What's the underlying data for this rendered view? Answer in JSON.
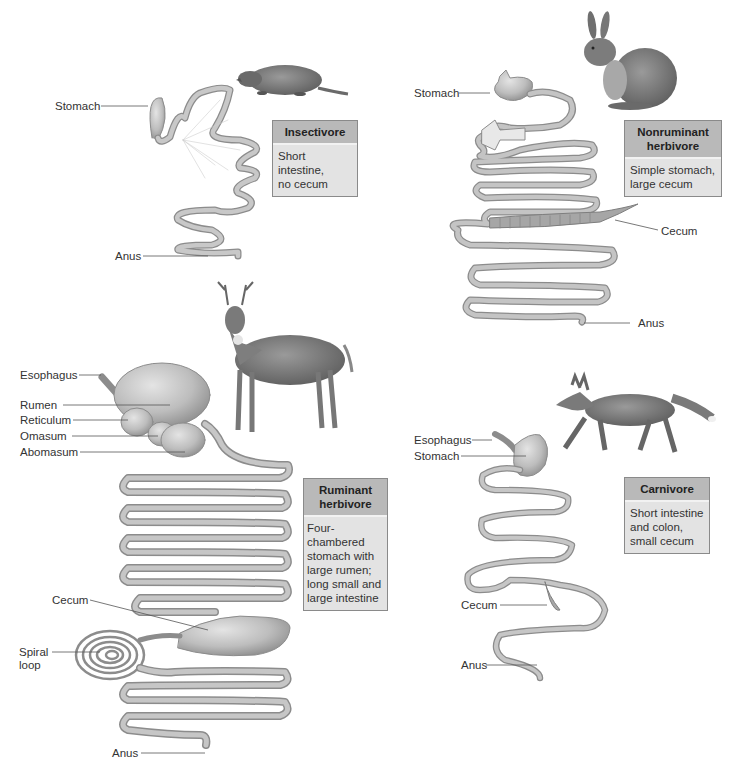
{
  "figure": {
    "colors": {
      "gut_fill": "#bdbdbd",
      "gut_stroke": "#8c8c8c",
      "gut_highlight": "#e6e6e6",
      "label_box_header": "#b9b9b9",
      "label_box_body": "#e3e3e3",
      "leader_line": "#555555"
    },
    "panels": [
      {
        "id": "insectivore",
        "animal": "shrew",
        "title": "Insectivore",
        "description": "Short intestine, no cecum",
        "labels": [
          "Stomach",
          "Anus"
        ]
      },
      {
        "id": "nonruminant",
        "animal": "rabbit",
        "title": "Nonruminant herbivore",
        "description": "Simple stomach, large cecum",
        "labels": [
          "Stomach",
          "Cecum",
          "Anus"
        ]
      },
      {
        "id": "ruminant",
        "animal": "deer",
        "title": "Ruminant herbivore",
        "description": "Four-chambered stomach with large rumen; long small and large intestine",
        "labels": [
          "Esophagus",
          "Rumen",
          "Reticulum",
          "Omasum",
          "Abomasum",
          "Cecum",
          "Spiral loop",
          "Anus"
        ]
      },
      {
        "id": "carnivore",
        "animal": "fox",
        "title": "Carnivore",
        "description": "Short intestine and colon, small cecum",
        "labels": [
          "Esophagus",
          "Stomach",
          "Cecum",
          "Anus"
        ]
      }
    ]
  },
  "insectivore": {
    "box": {
      "title": "Insectivore",
      "body_l1": "Short intestine,",
      "body_l2": "no cecum"
    },
    "labels": {
      "stomach": "Stomach",
      "anus": "Anus"
    }
  },
  "nonruminant": {
    "box": {
      "title_l1": "Nonruminant",
      "title_l2": "herbivore",
      "body_l1": "Simple stomach,",
      "body_l2": "large cecum"
    },
    "labels": {
      "stomach": "Stomach",
      "cecum": "Cecum",
      "anus": "Anus"
    }
  },
  "ruminant": {
    "box": {
      "title_l1": "Ruminant",
      "title_l2": "herbivore",
      "body_l1": "Four-chambered",
      "body_l2": "stomach with",
      "body_l3": "large rumen;",
      "body_l4": "long small and",
      "body_l5": "large intestine"
    },
    "labels": {
      "esophagus": "Esophagus",
      "rumen": "Rumen",
      "reticulum": "Reticulum",
      "omasum": "Omasum",
      "abomasum": "Abomasum",
      "cecum": "Cecum",
      "spiral_l1": "Spiral",
      "spiral_l2": "loop",
      "anus": "Anus"
    }
  },
  "carnivore": {
    "box": {
      "title": "Carnivore",
      "body_l1": "Short intestine",
      "body_l2": "and colon,",
      "body_l3": "small cecum"
    },
    "labels": {
      "esophagus": "Esophagus",
      "stomach": "Stomach",
      "cecum": "Cecum",
      "anus": "Anus"
    }
  }
}
